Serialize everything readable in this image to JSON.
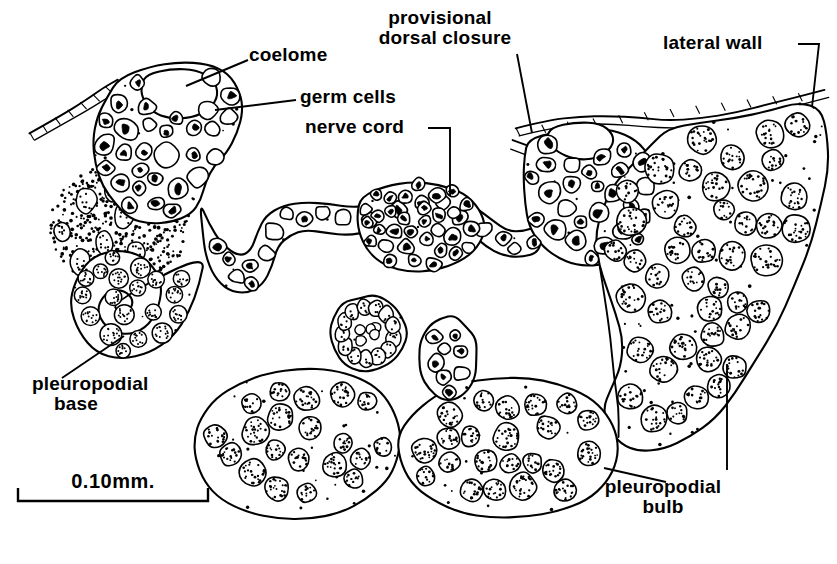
{
  "figure": {
    "kind": "scientific-line-drawing",
    "background_color": "#ffffff",
    "ink_color": "#000000"
  },
  "labels": [
    {
      "id": "coelome",
      "text": "coelome",
      "lines": [
        "coelome"
      ],
      "x": 249,
      "y": 45,
      "align": "left"
    },
    {
      "id": "germ-cells",
      "text": "germ cells",
      "lines": [
        "germ cells"
      ],
      "x": 300,
      "y": 87,
      "align": "left"
    },
    {
      "id": "nerve-cord",
      "text": "nerve cord",
      "lines": [
        "nerve cord"
      ],
      "x": 305,
      "y": 117,
      "align": "left"
    },
    {
      "id": "provisional-dorsal-closure",
      "text": "provisional dorsal closure",
      "lines": [
        "provisional",
        "dorsal closure"
      ],
      "x": 440,
      "y": 8,
      "align": "center"
    },
    {
      "id": "lateral-wall",
      "text": "lateral wall",
      "lines": [
        "lateral wall"
      ],
      "x": 663,
      "y": 33,
      "align": "left"
    },
    {
      "id": "pleuropodial-base",
      "text": "pleuropodial base",
      "lines": [
        "pleuropodial",
        "base"
      ],
      "x": 32,
      "y": 374,
      "align": "left"
    },
    {
      "id": "pleuropodial-bulb",
      "text": "pleuropodial bulb",
      "lines": [
        "pleuropodial",
        "bulb"
      ],
      "x": 663,
      "y": 477,
      "align": "center"
    }
  ],
  "leaders": [
    {
      "id": "leader-coelome",
      "points": "248,60 186,86"
    },
    {
      "id": "leader-germ-cells",
      "points": "296,100 215,110"
    },
    {
      "id": "leader-nerve-cord",
      "points": "428,128 450,128 450,196"
    },
    {
      "id": "leader-dorsal-closure",
      "points": "517,54 532,133"
    },
    {
      "id": "leader-lateral-wall",
      "points": "798,44 819,44 812,107"
    },
    {
      "id": "leader-pleuropodial-base",
      "points": "62,378 124,336"
    },
    {
      "id": "leader-pleuropodial-bulb-vertical",
      "points": "727,364 727,470"
    },
    {
      "id": "leader-pleuropodial-bulb-diagonal",
      "points": "666,482 604,468"
    }
  ],
  "scale_bar": {
    "id": "scale-bar",
    "text": "0.10mm.",
    "x1": 18,
    "x2": 208,
    "y": 501,
    "tick_height": 13,
    "label_x": 113,
    "label_y": 470
  },
  "anatomy": {
    "structures": [
      {
        "id": "left-body-wall",
        "name": "left lateral body wall"
      },
      {
        "id": "left-coelome",
        "name": "left coelomic cavity"
      },
      {
        "id": "left-germ-mass",
        "name": "left germ cell mass"
      },
      {
        "id": "nerve-cord",
        "name": "ventral nerve cord"
      },
      {
        "id": "right-coelome",
        "name": "right coelomic cavity"
      },
      {
        "id": "right-germ-mass",
        "name": "right germ cell mass"
      },
      {
        "id": "dorsal-closure",
        "name": "provisional dorsal closure"
      },
      {
        "id": "right-lateral-wall",
        "name": "right lateral wall"
      },
      {
        "id": "pleuropodial-base",
        "name": "pleuropodial base (U-shaped loop)"
      },
      {
        "id": "pleuropodial-bulb-right",
        "name": "right pleuropodial bulb"
      },
      {
        "id": "pleuropodial-bulb-lower-left",
        "name": "lower left pleuropodial bulb lobe"
      },
      {
        "id": "pleuropodial-bulb-lower-right",
        "name": "lower right pleuropodial bulb lobe"
      },
      {
        "id": "island-round",
        "name": "round sectioned islet"
      },
      {
        "id": "island-oval",
        "name": "oval sectioned islet"
      },
      {
        "id": "mesoderm-field",
        "name": "diffuse mesoderm stipple field"
      }
    ]
  }
}
